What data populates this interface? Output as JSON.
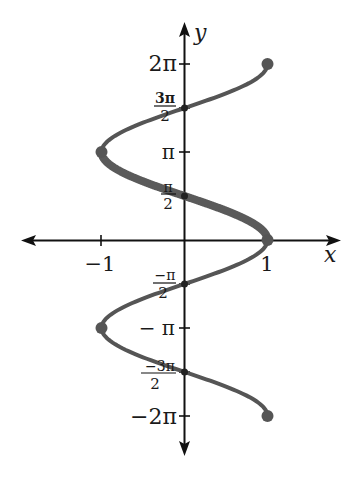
{
  "chart_data": {
    "type": "line",
    "title": "",
    "xlabel": "x",
    "ylabel": "y",
    "xlim": [
      -1.9,
      1.9
    ],
    "ylim": [
      -7.7,
      7.7
    ],
    "grid": false,
    "x_ticks": [
      {
        "value": -1,
        "label": "−1"
      },
      {
        "value": 1,
        "label": "1"
      }
    ],
    "y_ticks": [
      {
        "value": 6.2832,
        "label": "2π",
        "kind": "plain"
      },
      {
        "value": 4.7124,
        "label_num": "3π",
        "label_den": "2",
        "kind": "frac"
      },
      {
        "value": 3.1416,
        "label": "π",
        "kind": "plain"
      },
      {
        "value": 1.5708,
        "label_num": "π",
        "label_den": "2",
        "kind": "frac"
      },
      {
        "value": -1.5708,
        "label_num": "−π",
        "label_den": "2",
        "kind": "frac"
      },
      {
        "value": -3.1416,
        "label": "− π",
        "kind": "plain"
      },
      {
        "value": -4.7124,
        "label_num": "−3π",
        "label_den": "2",
        "kind": "frac"
      },
      {
        "value": -6.2832,
        "label": "−2π",
        "kind": "plain"
      }
    ],
    "series": [
      {
        "name": "x = cos y",
        "y_range": [
          -6.2832,
          6.2832
        ],
        "color": "#555555",
        "stroke_width": 4
      },
      {
        "name": "y = arccos x (principal branch)",
        "y_range": [
          0,
          3.1416
        ],
        "color": "#5a5a5a",
        "stroke_width": 8
      }
    ],
    "marked_points": [
      {
        "x": 1,
        "y": 6.2832,
        "label": "(1, 2π)"
      },
      {
        "x": 0,
        "y": 4.7124,
        "label": "(0, 3π/2)"
      },
      {
        "x": -1,
        "y": 3.1416,
        "label": "(−1, π)"
      },
      {
        "x": 0,
        "y": 1.5708,
        "label": "(0, π/2)"
      },
      {
        "x": 1,
        "y": 0,
        "label": "(1, 0)"
      },
      {
        "x": 0,
        "y": -1.5708,
        "label": "(0, −π/2)"
      },
      {
        "x": -1,
        "y": -3.1416,
        "label": "(−1, −π)"
      },
      {
        "x": 0,
        "y": -4.7124,
        "label": "(0, −3π/2)"
      },
      {
        "x": 1,
        "y": -6.2832,
        "label": "(1, −2π)"
      }
    ]
  },
  "axes": {
    "x_label": "x",
    "y_label": "y"
  },
  "colors": {
    "axis": "#111111",
    "curve": "#555555"
  }
}
